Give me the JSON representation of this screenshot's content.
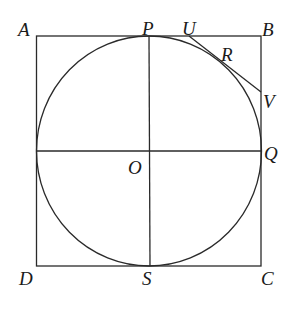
{
  "diagram": {
    "type": "geometry",
    "colors": {
      "stroke": "#2a2a2a",
      "text": "#1a1a1a",
      "background": "#ffffff"
    },
    "shapes": {
      "square": {
        "name": "ABCD",
        "vertices": [
          "A",
          "B",
          "C",
          "D"
        ]
      },
      "circle": {
        "center": "O",
        "tangent_points": [
          "P",
          "Q",
          "S",
          "R"
        ]
      },
      "segments": [
        {
          "from": "P",
          "to": "S",
          "label": "vertical diameter"
        },
        {
          "from": "D-side",
          "to": "Q",
          "label": "horizontal line through O"
        },
        {
          "from": "U",
          "to": "V",
          "label": "tangent at R"
        }
      ]
    },
    "labels": {
      "A": "A",
      "B": "B",
      "C": "C",
      "D": "D",
      "P": "P",
      "Q": "Q",
      "R": "R",
      "S": "S",
      "U": "U",
      "V": "V",
      "O": "O"
    }
  }
}
